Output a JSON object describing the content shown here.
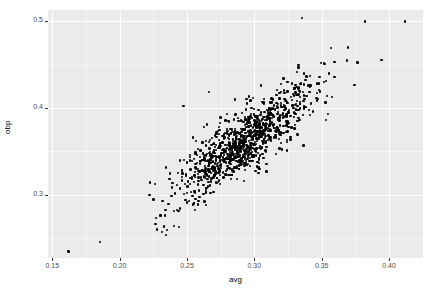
{
  "chart_data": {
    "type": "scatter",
    "title": "",
    "xlabel": "avg",
    "ylabel": "obp",
    "xlim": [
      0.1468,
      0.4252
    ],
    "ylim": [
      0.2272,
      0.5128
    ],
    "xticks": [
      0.15,
      0.2,
      0.25,
      0.3,
      0.35,
      0.4
    ],
    "xticklabels": [
      "0.15",
      "0.20",
      "0.25",
      "0.30",
      "0.35",
      "0.40"
    ],
    "yticks": [
      0.3,
      0.4,
      0.5
    ],
    "yticklabels": [
      "0.3",
      "0.4",
      "0.5"
    ],
    "x_minor_ticks": [
      0.175,
      0.225,
      0.275,
      0.325,
      0.375,
      0.425
    ],
    "y_minor_ticks": [
      0.25,
      0.35,
      0.45,
      0.55
    ],
    "grid": true,
    "legend": "none",
    "point_color": "#000000",
    "point_size": 2.4,
    "panel_background": "#ebebeb",
    "gridline_color": "#ffffff",
    "n_points": 1000,
    "correlation": 0.85,
    "x_mean": 0.2915,
    "x_sd": 0.0265,
    "y_mean": 0.3598,
    "y_sd": 0.0345,
    "notable_outliers": [
      {
        "x": 0.162,
        "y": 0.2345,
        "note": "low-low outlier"
      },
      {
        "x": 0.1855,
        "y": 0.2455,
        "note": "low-low outlier"
      },
      {
        "x": 0.3355,
        "y": 0.5035,
        "note": "high obp"
      },
      {
        "x": 0.382,
        "y": 0.4995,
        "note": "high obp high avg"
      },
      {
        "x": 0.412,
        "y": 0.4995,
        "note": "highest avg"
      },
      {
        "x": 0.2665,
        "y": 0.4185,
        "note": "high obp low avg"
      },
      {
        "x": 0.2475,
        "y": 0.4025,
        "note": "high obp low avg"
      },
      {
        "x": 0.3945,
        "y": 0.4555,
        "note": "high avg"
      }
    ]
  },
  "axes": {
    "x_title": "avg",
    "y_title": "obp"
  }
}
